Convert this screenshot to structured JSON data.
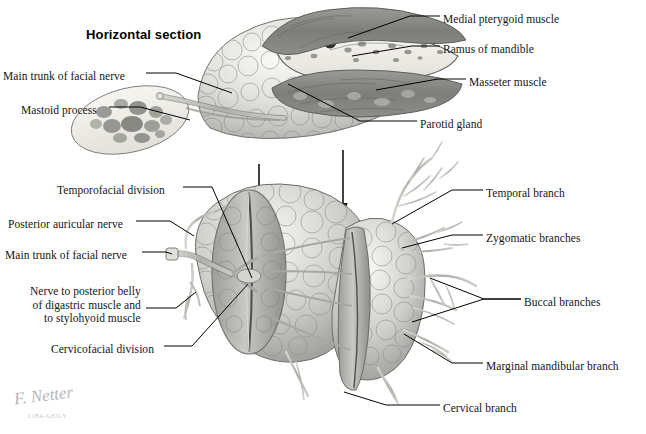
{
  "plate": {
    "title": "Horizontal section",
    "signature": "F. Netter",
    "copyright": "CIBA-GEIGY",
    "ink": "#151515",
    "leader_color": "#000000",
    "gland_light": "#e8e8e6",
    "gland_mid": "#bdbdb9",
    "gland_dark": "#8f8f8c",
    "muscle_dark": "#7e7e7b",
    "bone_light": "#f1efe9",
    "nerve_color": "#b9b9b4"
  },
  "upper_figure": {
    "name": "horizontal-section-diagram",
    "labels_left": [
      {
        "id": "main-trunk-facial-nerve-upper",
        "text": "Main trunk of facial nerve",
        "x": 3,
        "y": 70
      },
      {
        "id": "mastoid-process",
        "text": "Mastoid process",
        "x": 21,
        "y": 104
      }
    ],
    "labels_right": [
      {
        "id": "medial-pterygoid-muscle",
        "text": "Medial pterygoid muscle",
        "x": 443,
        "y": 13
      },
      {
        "id": "ramus-of-mandible",
        "text": "Ramus of mandible",
        "x": 443,
        "y": 43
      },
      {
        "id": "masseter-muscle",
        "text": "Masseter muscle",
        "x": 469,
        "y": 76
      },
      {
        "id": "parotid-gland",
        "text": "Parotid gland",
        "x": 420,
        "y": 118
      }
    ]
  },
  "lower_figure": {
    "name": "facial-nerve-branches-diagram",
    "labels_left": [
      {
        "id": "temporofacial-division",
        "text": "Temporofacial division",
        "x": 57,
        "y": 184
      },
      {
        "id": "posterior-auricular-nerve",
        "text": "Posterior auricular nerve",
        "x": 8,
        "y": 218
      },
      {
        "id": "main-trunk-facial-nerve-lower",
        "text": "Main trunk of facial nerve",
        "x": 5,
        "y": 249
      },
      {
        "id": "nerve-to-posterior-belly",
        "text": "Nerve to posterior belly\nof digastric muscle and\nto stylohyoid muscle",
        "x": 30,
        "y": 285
      },
      {
        "id": "cervicofacial-division",
        "text": "Cervicofacial division",
        "x": 51,
        "y": 343
      }
    ],
    "labels_right": [
      {
        "id": "temporal-branch",
        "text": "Temporal branch",
        "x": 486,
        "y": 187
      },
      {
        "id": "zygomatic-branches",
        "text": "Zygomatic branches",
        "x": 486,
        "y": 232
      },
      {
        "id": "buccal-branches",
        "text": "Buccal branches",
        "x": 524,
        "y": 296
      },
      {
        "id": "marginal-mandibular-branch",
        "text": "Marginal mandibular branch",
        "x": 486,
        "y": 360
      },
      {
        "id": "cervical-branch",
        "text": "Cervical branch",
        "x": 443,
        "y": 402
      }
    ]
  },
  "arrows": [
    {
      "id": "arrow-left",
      "x": 259,
      "y1": 164,
      "y2": 202
    },
    {
      "id": "arrow-right",
      "x": 343,
      "y1": 150,
      "y2": 216
    }
  ]
}
